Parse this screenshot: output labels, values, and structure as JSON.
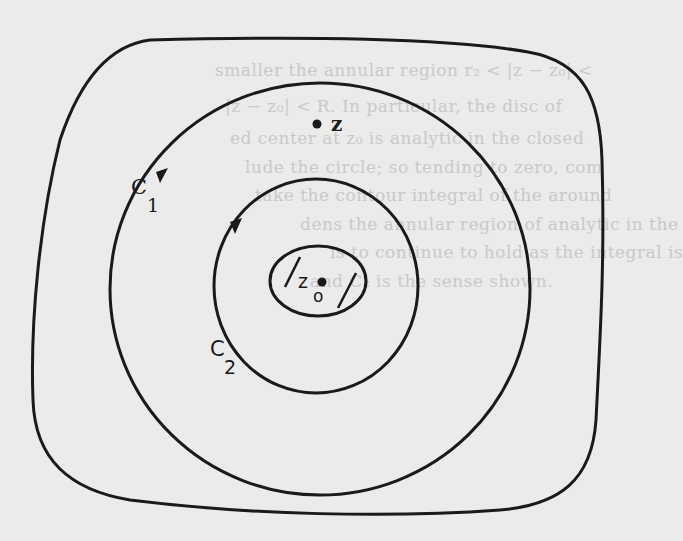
{
  "diagram": {
    "type": "contour-diagram",
    "colors": {
      "background": "#ebebeb",
      "stroke": "#1a1a1a",
      "bleed_text": "#c9c9c9"
    },
    "outer_region": {
      "shape": "rounded-square"
    },
    "contours": [
      {
        "id": "C1",
        "label": "C",
        "subscript": "1",
        "shape": "circle",
        "orientation": "counterclockwise"
      },
      {
        "id": "C2",
        "label": "C",
        "subscript": "2",
        "shape": "circle",
        "orientation": "counterclockwise"
      }
    ],
    "excluded_region": {
      "shape": "ellipse",
      "hatch_marks": 2
    },
    "points": [
      {
        "id": "z",
        "label": "z"
      },
      {
        "id": "z0",
        "label": "z",
        "subscript": "o"
      }
    ]
  },
  "bleed_through_text": [
    "smaller the annular region  r₂ < |z − z₀| <",
    "|z − z₀| < R.  In particular, the disc of",
    "ed center at z₀ is analytic in the closed",
    "lude the circle; so  tending to zero, com",
    "take the contour integral of the  around",
    "dens the annular region of analytic in the",
    "is to continue to hold as the integral is",
    "and C₂ is the sense shown."
  ]
}
